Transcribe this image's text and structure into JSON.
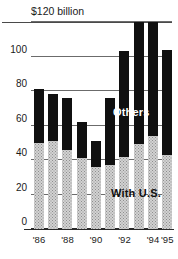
{
  "chart_data": {
    "type": "bar",
    "stacked": true,
    "title": "",
    "subtitle": "",
    "xlabel": "",
    "ylabel": "",
    "unit_label": "$120 billion",
    "ylim": [
      0,
      120
    ],
    "yticks": [
      0,
      20,
      40,
      60,
      80,
      100,
      120
    ],
    "ytick_labels": [
      "0",
      "20",
      "40",
      "60",
      "80",
      "100",
      "$120 billion"
    ],
    "grid": true,
    "legend_position": "inside-plot",
    "categories": [
      "'86",
      "'87",
      "'88",
      "'89",
      "'90",
      "'91",
      "'92",
      "'93",
      "'94",
      "'95"
    ],
    "xtick_labels_shown": [
      "'86",
      "'88",
      "'90",
      "'92",
      "'94",
      "'95"
    ],
    "series": [
      {
        "name": "With U.S.",
        "color": "#d2d2d2",
        "values": [
          50,
          51,
          46,
          41,
          36,
          37,
          42,
          49,
          54,
          43
        ]
      },
      {
        "name": "Others",
        "color": "#101010",
        "values": [
          31,
          27,
          30,
          21,
          15,
          39,
          61,
          71,
          66,
          61
        ]
      }
    ],
    "totals": [
      81,
      78,
      76,
      62,
      51,
      76,
      103,
      120,
      120,
      104
    ]
  },
  "legend": {
    "others_label": "Others",
    "with_us_label": "With U.S."
  }
}
